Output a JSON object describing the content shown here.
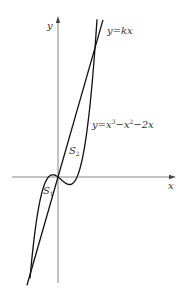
{
  "figure": {
    "axes": {
      "x_label": "x",
      "y_label": "y",
      "origin_px": [
        58,
        177
      ],
      "x_axis_px": [
        12,
        176
      ],
      "y_axis_px": [
        283,
        16
      ]
    },
    "curves": [
      {
        "name": "line",
        "label_prefix": "y=kx",
        "color": "#111111"
      },
      {
        "name": "cubic",
        "label_prefix": "y=x",
        "color": "#111111"
      }
    ],
    "labels": {
      "line": "y=kx",
      "cubic_part1": "y=x",
      "cubic_exp1": "3",
      "cubic_part2": "−x",
      "cubic_exp2": "2",
      "cubic_part3": "−2x",
      "region1_base": "S",
      "region1_sub": "1",
      "region2_base": "S",
      "region2_sub": "2"
    },
    "colors": {
      "axis": "#555555",
      "curve": "#111111",
      "text": "#333333"
    }
  }
}
